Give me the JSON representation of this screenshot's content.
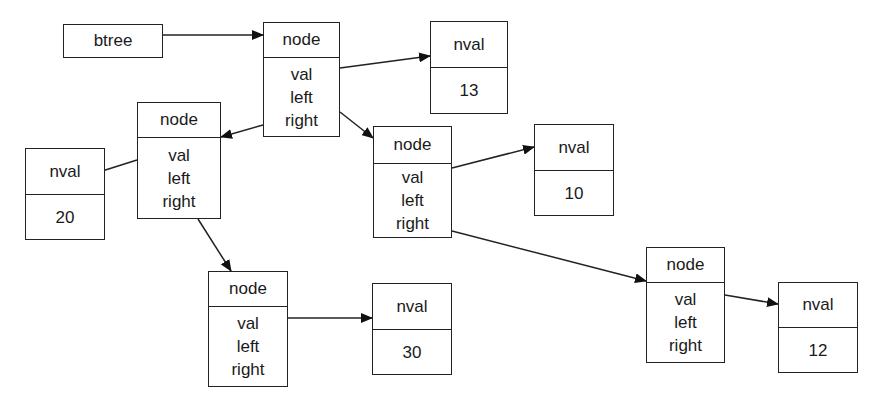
{
  "diagram": {
    "type": "linked-structure",
    "root_pointer": {
      "id": "btree",
      "label": "btree"
    },
    "nodes": [
      {
        "id": "n1",
        "title": "node",
        "fields": [
          "val",
          "left",
          "right"
        ]
      },
      {
        "id": "n2",
        "title": "node",
        "fields": [
          "val",
          "left",
          "right"
        ]
      },
      {
        "id": "n3",
        "title": "node",
        "fields": [
          "val",
          "left",
          "right"
        ]
      },
      {
        "id": "n4",
        "title": "node",
        "fields": [
          "val",
          "left",
          "right"
        ]
      },
      {
        "id": "n5",
        "title": "node",
        "fields": [
          "val",
          "left",
          "right"
        ]
      }
    ],
    "values": [
      {
        "id": "v13",
        "title": "nval",
        "value": "13"
      },
      {
        "id": "v20",
        "title": "nval",
        "value": "20"
      },
      {
        "id": "v10",
        "title": "nval",
        "value": "10"
      },
      {
        "id": "v30",
        "title": "nval",
        "value": "30"
      },
      {
        "id": "v12",
        "title": "nval",
        "value": "12"
      }
    ],
    "edges": [
      {
        "from": "btree",
        "to": "n1"
      },
      {
        "from": "n1.val",
        "to": "v13"
      },
      {
        "from": "n1.left",
        "to": "n2"
      },
      {
        "from": "n1.right",
        "to": "n3"
      },
      {
        "from": "n2.val",
        "to": "v20"
      },
      {
        "from": "n2.right",
        "to": "n4"
      },
      {
        "from": "n3.val",
        "to": "v10"
      },
      {
        "from": "n3.right",
        "to": "n5"
      },
      {
        "from": "n4.val",
        "to": "v30"
      },
      {
        "from": "n5.val",
        "to": "v12"
      }
    ]
  }
}
